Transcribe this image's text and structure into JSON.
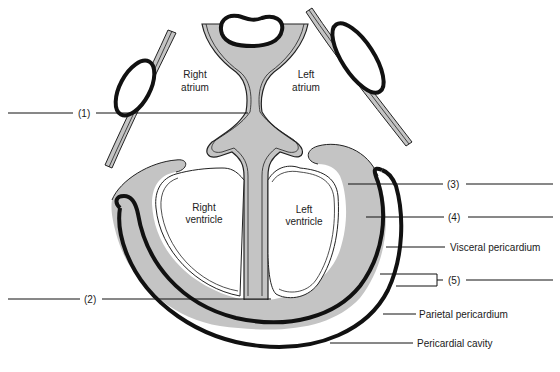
{
  "diagram": {
    "title": "",
    "colors": {
      "myocardium": "#c4c4c4",
      "outline": "#111111",
      "background": "#ffffff"
    },
    "chambers": [
      {
        "id": "right-atrium",
        "line1": "Right",
        "line2": "atrium"
      },
      {
        "id": "left-atrium",
        "line1": "Left",
        "line2": "atrium"
      },
      {
        "id": "right-ventricle",
        "line1": "Right",
        "line2": "ventricle"
      },
      {
        "id": "left-ventricle",
        "line1": "Left",
        "line2": "ventricle"
      }
    ],
    "labels": {
      "l1": "(1)",
      "l2": "(2)",
      "l3": "(3)",
      "l4": "(4)",
      "visceral": "Visceral pericardium",
      "l5": "(5)",
      "parietal": "Parietal pericardium",
      "cavity": "Pericardial cavity"
    }
  }
}
